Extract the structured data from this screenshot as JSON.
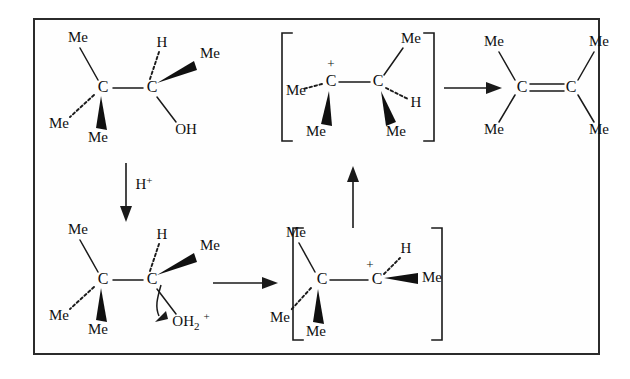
{
  "diagram": {
    "frame_color": "#2b2b2b",
    "background": "#ffffff",
    "ink": "#101010"
  },
  "labels": {
    "me": "Me",
    "h": "H",
    "c": "C",
    "oh": "OH",
    "o": "O",
    "h_water": "H",
    "water_sub": "2",
    "plus": "+",
    "hplus_h": "H",
    "hplus_sign": "+"
  },
  "structures": [
    {
      "id": "alcohol",
      "name": "2,3-dimethylbutan-2-ol",
      "bracketed": false,
      "atoms": [
        {
          "symbol": "C",
          "role": "c1"
        },
        {
          "symbol": "C",
          "role": "c2"
        }
      ],
      "substituents": [
        {
          "label": "Me",
          "on": "c1",
          "bond": "plain",
          "dir": "up-left"
        },
        {
          "label": "Me",
          "on": "c1",
          "bond": "dashed",
          "dir": "down-left"
        },
        {
          "label": "Me",
          "on": "c1",
          "bond": "wedge",
          "dir": "down"
        },
        {
          "label": "H",
          "on": "c2",
          "bond": "dashed",
          "dir": "up"
        },
        {
          "label": "Me",
          "on": "c2",
          "bond": "wedge",
          "dir": "up-right"
        },
        {
          "label": "OH",
          "on": "c2",
          "bond": "plain",
          "dir": "down-right"
        }
      ]
    },
    {
      "id": "oxonium",
      "name": "protonated alcohol",
      "bracketed": false,
      "atoms": [
        {
          "symbol": "C",
          "role": "c1"
        },
        {
          "symbol": "C",
          "role": "c2"
        }
      ],
      "substituents": [
        {
          "label": "Me",
          "on": "c1",
          "bond": "plain",
          "dir": "up-left"
        },
        {
          "label": "Me",
          "on": "c1",
          "bond": "dashed",
          "dir": "down-left"
        },
        {
          "label": "Me",
          "on": "c1",
          "bond": "wedge",
          "dir": "down"
        },
        {
          "label": "H",
          "on": "c2",
          "bond": "dashed",
          "dir": "up"
        },
        {
          "label": "Me",
          "on": "c2",
          "bond": "wedge",
          "dir": "up-right"
        },
        {
          "label": "OH2+",
          "on": "c2",
          "bond": "plain",
          "dir": "down-right"
        }
      ],
      "curly_arrow": "C-O bond breaking, water leaves"
    },
    {
      "id": "secondary-cation",
      "name": "secondary carbocation",
      "bracketed": true,
      "charge": "+",
      "charge_on": "c2",
      "atoms": [
        {
          "symbol": "C",
          "role": "c1"
        },
        {
          "symbol": "C",
          "role": "c2"
        }
      ],
      "substituents": [
        {
          "label": "Me",
          "on": "c1",
          "bond": "plain",
          "dir": "up-left"
        },
        {
          "label": "Me",
          "on": "c1",
          "bond": "dashed",
          "dir": "down-left"
        },
        {
          "label": "Me",
          "on": "c1",
          "bond": "wedge",
          "dir": "down"
        },
        {
          "label": "H",
          "on": "c2",
          "bond": "dashed",
          "dir": "up-right"
        },
        {
          "label": "Me",
          "on": "c2",
          "bond": "wedge",
          "dir": "right"
        }
      ]
    },
    {
      "id": "tertiary-cation",
      "name": "tertiary carbocation after hydride shift",
      "bracketed": true,
      "charge": "+",
      "charge_on": "c1",
      "atoms": [
        {
          "symbol": "C",
          "role": "c1"
        },
        {
          "symbol": "C",
          "role": "c2"
        }
      ],
      "substituents": [
        {
          "label": "Me",
          "on": "c1",
          "bond": "dashed",
          "dir": "left"
        },
        {
          "label": "Me",
          "on": "c1",
          "bond": "wedge",
          "dir": "down"
        },
        {
          "label": "Me",
          "on": "c2",
          "bond": "plain",
          "dir": "up-right"
        },
        {
          "label": "H",
          "on": "c2",
          "bond": "dashed",
          "dir": "right"
        },
        {
          "label": "Me",
          "on": "c2",
          "bond": "wedge",
          "dir": "down"
        }
      ]
    },
    {
      "id": "alkene",
      "name": "tetramethylethylene",
      "bracketed": false,
      "bond_order": 2,
      "atoms": [
        {
          "symbol": "C",
          "role": "c1"
        },
        {
          "symbol": "C",
          "role": "c2"
        }
      ],
      "substituents": [
        {
          "label": "Me",
          "on": "c1",
          "bond": "plain",
          "dir": "up-left"
        },
        {
          "label": "Me",
          "on": "c1",
          "bond": "plain",
          "dir": "down-left"
        },
        {
          "label": "Me",
          "on": "c2",
          "bond": "plain",
          "dir": "up-right"
        },
        {
          "label": "Me",
          "on": "c2",
          "bond": "plain",
          "dir": "down-right"
        }
      ]
    }
  ],
  "arrows": [
    {
      "id": "protonation",
      "from": "alcohol",
      "to": "oxonium",
      "direction": "down",
      "label": "H+"
    },
    {
      "id": "ionisation",
      "from": "oxonium",
      "to": "secondary-cation",
      "direction": "right",
      "label": ""
    },
    {
      "id": "hydride-shift",
      "from": "secondary-cation",
      "to": "tertiary-cation",
      "direction": "up",
      "label": ""
    },
    {
      "id": "elimination",
      "from": "tertiary-cation",
      "to": "alkene",
      "direction": "right",
      "label": ""
    }
  ]
}
